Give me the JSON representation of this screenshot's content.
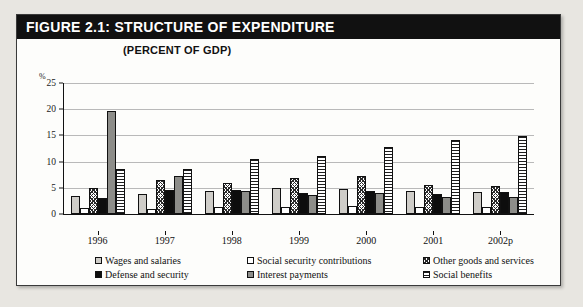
{
  "figure": {
    "title": "FIGURE 2.1: STRUCTURE OF EXPENDITURE",
    "subtitle": "(PERCENT OF GDP)",
    "unit_label": "%"
  },
  "chart_data": {
    "type": "bar",
    "title": "FIGURE 2.1: STRUCTURE OF EXPENDITURE",
    "subtitle": "(PERCENT OF GDP)",
    "xlabel": "",
    "ylabel": "%",
    "ylim": [
      0,
      25
    ],
    "yticks": [
      0,
      5,
      10,
      15,
      20,
      25
    ],
    "grid": true,
    "legend_position": "bottom",
    "categories": [
      "1996",
      "1997",
      "1998",
      "1999",
      "2000",
      "2001",
      "2002p"
    ],
    "series": [
      {
        "name": "Wages and salaries",
        "key": "s0",
        "values": [
          3.5,
          3.8,
          4.4,
          5.0,
          4.8,
          4.3,
          4.2
        ]
      },
      {
        "name": "Social security contributions",
        "key": "s1",
        "values": [
          1.2,
          1.0,
          1.3,
          1.4,
          1.5,
          1.3,
          1.3
        ]
      },
      {
        "name": "Other goods and services",
        "key": "s2",
        "values": [
          5.0,
          6.4,
          6.0,
          6.9,
          7.3,
          5.6,
          5.3
        ]
      },
      {
        "name": "Defense and security",
        "key": "s3",
        "values": [
          3.0,
          4.5,
          4.5,
          4.0,
          4.3,
          3.9,
          4.2
        ]
      },
      {
        "name": "Interest payments",
        "key": "s4",
        "values": [
          19.6,
          7.2,
          4.3,
          3.6,
          4.1,
          3.3,
          3.2
        ]
      },
      {
        "name": "Social benefits",
        "key": "s5",
        "values": [
          8.5,
          8.6,
          10.5,
          11.1,
          12.8,
          14.1,
          14.8
        ]
      }
    ]
  },
  "legend": {
    "rows": [
      [
        {
          "label": "Wages and salaries",
          "key": "s0"
        },
        {
          "label": "Social security contributions",
          "key": "s1"
        },
        {
          "label": "Other goods and services",
          "key": "s2"
        }
      ],
      [
        {
          "label": "Defense and security",
          "key": "s3"
        },
        {
          "label": "Interest payments",
          "key": "s4"
        },
        {
          "label": "Social benefits",
          "key": "s5"
        }
      ]
    ]
  }
}
